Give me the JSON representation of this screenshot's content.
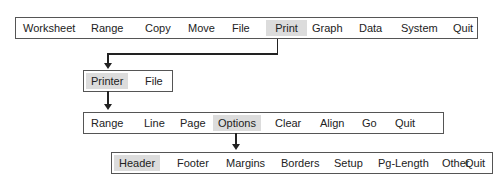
{
  "menus": {
    "main": {
      "items": [
        "Worksheet",
        "Range",
        "Copy",
        "Move",
        "File",
        "Print",
        "Graph",
        "Data",
        "System",
        "Quit"
      ],
      "selected": "Print"
    },
    "print": {
      "items": [
        "Printer",
        "File"
      ],
      "selected": "Printer"
    },
    "printer": {
      "items": [
        "Range",
        "Line",
        "Page",
        "Options",
        "Clear",
        "Align",
        "Go",
        "Quit"
      ],
      "selected": "Options"
    },
    "options": {
      "items": [
        "Header",
        "Footer",
        "Margins",
        "Borders",
        "Setup",
        "Pg-Length",
        "Other",
        "Quit"
      ],
      "selected": "Header"
    }
  },
  "colors": {
    "highlight": "#dcdcdc",
    "border": "#555555",
    "connector": "#222222"
  }
}
